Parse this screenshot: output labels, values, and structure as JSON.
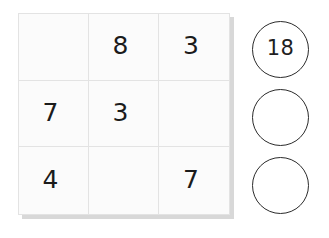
{
  "puzzle": {
    "type": "magic-square-sum-puzzle",
    "background_color": "#ffffff",
    "grid": {
      "rows": 3,
      "cols": 3,
      "cell_fill_color": "#fbfbfb",
      "cell_border_color": "#e3e3e3",
      "shadow_color": "#b8b8b8",
      "digit_color": "#1b1b1b",
      "cells": [
        [
          {
            "value": "",
            "filled": false
          },
          {
            "value": "8",
            "filled": true
          },
          {
            "value": "3",
            "filled": true
          }
        ],
        [
          {
            "value": "7",
            "filled": true
          },
          {
            "value": "3",
            "filled": true
          },
          {
            "value": "",
            "filled": false
          }
        ],
        [
          {
            "value": "4",
            "filled": true
          },
          {
            "value": "",
            "filled": false
          },
          {
            "value": "7",
            "filled": true
          }
        ]
      ]
    },
    "answer_circles": {
      "outline_color": "#2b2b2b",
      "fill_color": "#ffffff",
      "text_color": "#1f1f1f",
      "items": [
        {
          "value": "18",
          "filled": true
        },
        {
          "value": "",
          "filled": false
        },
        {
          "value": "",
          "filled": false
        }
      ]
    }
  }
}
